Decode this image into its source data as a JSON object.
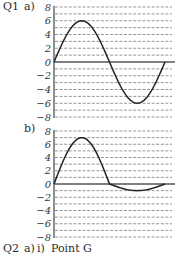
{
  "labels": {
    "q1": "Q1",
    "q1a": "a)",
    "q1b": "b)",
    "q2": "Q2",
    "q2a": "a)",
    "q2ai": "i)",
    "q2ai_answer": "Point G"
  },
  "chart_data": [
    {
      "type": "line",
      "title": "Q1 a)",
      "xlabel": "",
      "ylabel": "",
      "ylim": [
        -8,
        8
      ],
      "yticks": [
        8,
        6,
        4,
        2,
        0,
        -2,
        -4,
        -6,
        -8
      ],
      "grid": "dashed horizontal lines every 1 unit",
      "x": [
        0,
        0.125,
        0.25,
        0.375,
        0.5,
        0.625,
        0.75,
        0.875,
        1.0
      ],
      "values": [
        0,
        4.2,
        6,
        4.2,
        0,
        -4.2,
        -6,
        -4.2,
        0
      ],
      "description": "One full sine cycle, amplitude 6"
    },
    {
      "type": "line",
      "title": "Q1 b)",
      "xlabel": "",
      "ylabel": "",
      "ylim": [
        -8,
        8
      ],
      "yticks": [
        8,
        6,
        4,
        2,
        0,
        -2,
        -4,
        -6,
        -8
      ],
      "grid": "dashed horizontal lines every 1 unit",
      "x": [
        0,
        0.125,
        0.25,
        0.375,
        0.5,
        0.625,
        0.75,
        0.875,
        1.0
      ],
      "values": [
        0,
        4.9,
        7,
        4.9,
        0,
        -0.7,
        -1,
        -0.7,
        0
      ],
      "description": "Positive half-cycle peak 7, negative half-cycle trough about -1"
    }
  ]
}
